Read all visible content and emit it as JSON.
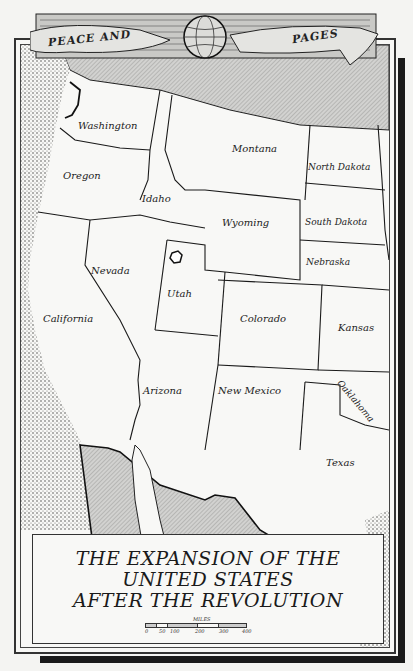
{
  "banner": {
    "left_text": "PEACE AND",
    "right_text": "PAGES",
    "emblem": "globe-icon"
  },
  "map": {
    "states": [
      {
        "name": "Washington",
        "x": 78,
        "y": 125
      },
      {
        "name": "Oregon",
        "x": 63,
        "y": 175
      },
      {
        "name": "Idaho",
        "x": 142,
        "y": 198
      },
      {
        "name": "Montana",
        "x": 232,
        "y": 148
      },
      {
        "name": "North Dakota",
        "x": 308,
        "y": 167
      },
      {
        "name": "South Dakota",
        "x": 305,
        "y": 222
      },
      {
        "name": "Wyoming",
        "x": 222,
        "y": 222
      },
      {
        "name": "Nebraska",
        "x": 306,
        "y": 262
      },
      {
        "name": "Nevada",
        "x": 91,
        "y": 270
      },
      {
        "name": "Utah",
        "x": 167,
        "y": 293
      },
      {
        "name": "California",
        "x": 43,
        "y": 318
      },
      {
        "name": "Colorado",
        "x": 240,
        "y": 318
      },
      {
        "name": "Kansas",
        "x": 338,
        "y": 327
      },
      {
        "name": "Oaklahoma",
        "x": 347,
        "y": 378
      },
      {
        "name": "Arizona",
        "x": 143,
        "y": 390
      },
      {
        "name": "New Mexico",
        "x": 218,
        "y": 390
      },
      {
        "name": "Texas",
        "x": 326,
        "y": 462
      }
    ]
  },
  "title": {
    "line1": "THE EXPANSION OF THE",
    "line2": "UNITED STATES",
    "line3": "AFTER THE REVOLUTION"
  },
  "scale": {
    "label": "MILES",
    "ticks": [
      "0",
      "50",
      "100",
      "200",
      "300",
      "400"
    ]
  },
  "colors": {
    "ink": "#1a1a1a",
    "paper": "#f8f8f6",
    "hatch": "#b8b8b8"
  }
}
